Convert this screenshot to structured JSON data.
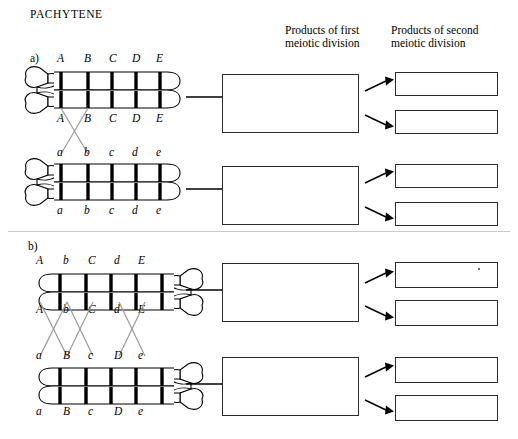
{
  "title": "PACHYTENE",
  "headers": {
    "first": "Products of first\nmeiotic division",
    "second": "Products of second\nmeiotic division"
  },
  "parts": [
    {
      "id": "a",
      "label": "a)",
      "centromere_side": "left",
      "crossovers_description": "single crossover between gene positions 1 and 2 of the inner chromatids",
      "bivalents": [
        {
          "name": "upper-homolog",
          "chromatid_top_labels": [
            "A",
            "B",
            "C",
            "D",
            "E"
          ],
          "chromatid_bottom_labels": [
            "A",
            "B",
            "C",
            "D",
            "E"
          ]
        },
        {
          "name": "lower-homolog",
          "chromatid_top_labels": [
            "a",
            "b",
            "c",
            "d",
            "e"
          ],
          "chromatid_bottom_labels": [
            "a",
            "b",
            "c",
            "d",
            "e"
          ]
        }
      ],
      "first_division_boxes": [
        "",
        ""
      ],
      "second_division_boxes": [
        "",
        "",
        "",
        ""
      ]
    },
    {
      "id": "b",
      "label": "b)",
      "centromere_side": "right",
      "crossovers_description": "three crossovers between the inner chromatids",
      "bivalents": [
        {
          "name": "upper-homolog",
          "chromatid_top_labels": [
            "A",
            "b",
            "C",
            "d",
            "E"
          ],
          "chromatid_bottom_labels": [
            "A",
            "b",
            "C",
            "d",
            "E"
          ]
        },
        {
          "name": "lower-homolog",
          "chromatid_top_labels": [
            "a",
            "B",
            "c",
            "D",
            "e"
          ],
          "chromatid_bottom_labels": [
            "a",
            "B",
            "c",
            "D",
            "e"
          ]
        }
      ],
      "first_division_boxes": [
        "",
        ""
      ],
      "second_division_boxes": [
        "",
        "",
        "",
        ""
      ]
    }
  ],
  "colors": {
    "ink": "#000000",
    "box_border": "#2b2b2b",
    "crossover_line": "#8a8a8a",
    "band": "#000000"
  }
}
